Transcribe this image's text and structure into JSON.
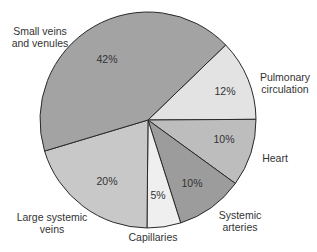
{
  "chart_data": {
    "type": "pie",
    "title": "",
    "start_angle_deg": 46,
    "direction": "clockwise",
    "slices": [
      {
        "label": "Pulmonary\ncirculation",
        "value": 12,
        "pct_label": "12%",
        "color": "#e3e3e3"
      },
      {
        "label": "Heart",
        "value": 10,
        "pct_label": "10%",
        "color": "#bdbdbd"
      },
      {
        "label": "Systemic\narteries",
        "value": 10,
        "pct_label": "10%",
        "color": "#9c9c9c"
      },
      {
        "label": "Capillaries",
        "value": 5,
        "pct_label": "5%",
        "color": "#efefef"
      },
      {
        "label": "Large systemic\nveins",
        "value": 20,
        "pct_label": "20%",
        "color": "#c8c8c8"
      },
      {
        "label": "Small veins\nand venules",
        "value": 42,
        "pct_label": "42%",
        "color": "#a3a3a3"
      }
    ],
    "center": [
      148,
      120
    ],
    "radius": 108,
    "legend": "none (direct labels)"
  },
  "labels": {
    "pulmonary": "Pulmonary\ncirculation",
    "heart": "Heart",
    "systemic_arteries": "Systemic\narteries",
    "capillaries": "Capillaries",
    "large_veins": "Large systemic\nveins",
    "small_veins": "Small veins\nand venules"
  },
  "percents": {
    "pulmonary": "12%",
    "heart": "10%",
    "systemic_arteries": "10%",
    "capillaries": "5%",
    "large_veins": "20%",
    "small_veins": "42%"
  }
}
